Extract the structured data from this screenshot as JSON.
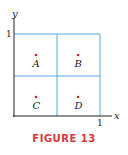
{
  "figure": {
    "caption": "FIGURE 13",
    "caption_color": "#d9363e",
    "grid_color": "#5aa7d6",
    "axis_color": "#222222",
    "point_color": "#c62828",
    "axes": {
      "x_label": "x",
      "y_label": "y",
      "x_tick": "1",
      "y_tick": "1"
    },
    "regions": [
      {
        "label": "A",
        "position": "top-left"
      },
      {
        "label": "B",
        "position": "top-right"
      },
      {
        "label": "C",
        "position": "bottom-left"
      },
      {
        "label": "D",
        "position": "bottom-right"
      }
    ]
  }
}
